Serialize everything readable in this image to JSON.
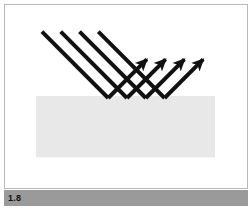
{
  "figure": {
    "number_label": "1.8",
    "caption": "",
    "card_background": "#ffffff",
    "card_border_color": "#b9b9b9",
    "footer_background": "#9a9a9a",
    "footer_text_color": "#111111"
  },
  "diagram": {
    "type": "specular-reflection",
    "title": "",
    "surface": {
      "name": "reflecting-surface",
      "fill": "#e8e8e8",
      "x": 31,
      "y": 92,
      "width": 181,
      "height": 62
    },
    "ray_color": "#111111",
    "ray_width": 4,
    "incident_rays": [
      {
        "name": "incident-ray-1",
        "x1": 37,
        "y1": 27,
        "x2": 104,
        "y2": 94
      },
      {
        "name": "incident-ray-2",
        "x1": 56,
        "y1": 27,
        "x2": 123,
        "y2": 94
      },
      {
        "name": "incident-ray-3",
        "x1": 75,
        "y1": 27,
        "x2": 142,
        "y2": 94
      },
      {
        "name": "incident-ray-4",
        "x1": 94,
        "y1": 27,
        "x2": 161,
        "y2": 94
      }
    ],
    "reflected_rays": [
      {
        "name": "reflected-ray-1",
        "x1": 104,
        "y1": 94,
        "x2": 143,
        "y2": 55
      },
      {
        "name": "reflected-ray-2",
        "x1": 123,
        "y1": 94,
        "x2": 162,
        "y2": 55
      },
      {
        "name": "reflected-ray-3",
        "x1": 142,
        "y1": 94,
        "x2": 181,
        "y2": 55
      },
      {
        "name": "reflected-ray-4",
        "x1": 161,
        "y1": 94,
        "x2": 200,
        "y2": 55
      }
    ],
    "incidence_angle_deg": 45,
    "reflection_angle_deg": 45
  }
}
